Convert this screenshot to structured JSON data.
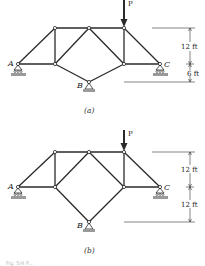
{
  "figure": {
    "panels": [
      {
        "id": "a",
        "caption": "(a)",
        "load_label": "P",
        "support_labels": {
          "left": "A",
          "bottom": "B",
          "right": "C"
        },
        "dimensions": {
          "upper": "12 ft",
          "lower": "6 ft"
        }
      },
      {
        "id": "b",
        "caption": "(b)",
        "load_label": "P",
        "support_labels": {
          "left": "A",
          "bottom": "B",
          "right": "C"
        },
        "dimensions": {
          "upper": "12 ft",
          "lower": "12 ft"
        }
      }
    ],
    "footer_caption": "Fig. 5/4 P..."
  }
}
